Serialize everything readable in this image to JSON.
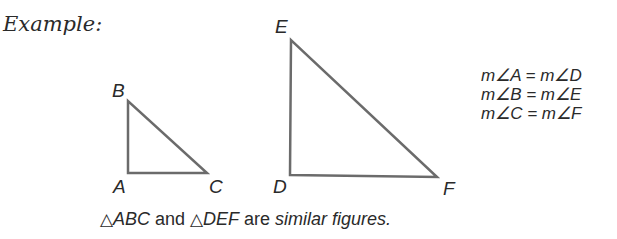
{
  "heading": "Example:",
  "triangle_small": {
    "labels": {
      "A": "A",
      "B": "B",
      "C": "C"
    }
  },
  "triangle_large": {
    "labels": {
      "D": "D",
      "E": "E",
      "F": "F"
    }
  },
  "equations": [
    "m∠A = m∠D",
    "m∠B = m∠E",
    "m∠C = m∠F"
  ],
  "caption": {
    "tri_symbol": "△",
    "first": "ABC",
    "and": " and ",
    "second": "DEF",
    "are": " are ",
    "term": "similar figures."
  },
  "colors": {
    "line": "#6b6b6b",
    "text": "#2a2a2a"
  }
}
